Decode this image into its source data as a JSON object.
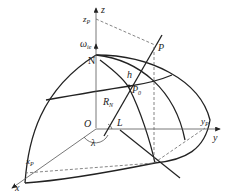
{
  "diagram": {
    "title": "",
    "labels": {
      "z_axis": "z",
      "z_p": "z",
      "z_p_sub": "P",
      "omega": "ω",
      "omega_sub": "ie",
      "north": "N",
      "point_p": "P",
      "height": "h",
      "point_p0": "P",
      "point_p0_sub": "0",
      "radius": "R",
      "radius_sub": "N",
      "origin": "O",
      "latitude": "L",
      "longitude": "λ",
      "y_p": "y",
      "y_p_sub": "P",
      "y_axis": "y",
      "x_p": "x",
      "x_p_sub": "P",
      "x_axis": "x"
    }
  }
}
